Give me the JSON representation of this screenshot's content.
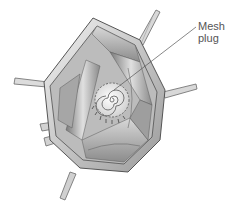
{
  "figure": {
    "label": {
      "line1": "Mesh",
      "line2": "plug"
    },
    "colors": {
      "background": "#ffffff",
      "tissue_light": "#e6e6e6",
      "tissue_mid": "#bdbdbd",
      "tissue_dark": "#6e6e6e",
      "outline": "#4a4a4a",
      "label_text": "#555555"
    }
  }
}
